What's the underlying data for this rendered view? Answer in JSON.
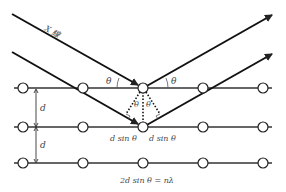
{
  "diagram": {
    "type": "bragg-diffraction",
    "incident_label": "X 線",
    "angle_label": "θ",
    "spacing_label": "d",
    "path_diff_left": "d sin θ",
    "path_diff_right": "d sin θ",
    "equation": "2d sin θ = nλ",
    "rows": 3,
    "atoms_per_row": 5,
    "colors": {
      "line": "#222222",
      "atom_fill": "#ffffff",
      "text": "#444444"
    }
  }
}
